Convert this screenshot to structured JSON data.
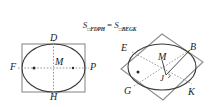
{
  "background_color": "#ffffff",
  "formula": {
    "left_symbol": "S",
    "left_quad_mark": "□",
    "left_subscript": "FDPH",
    "equals": "=",
    "right_symbol": "S",
    "right_quad_mark": "□",
    "right_subscript": "BEGK",
    "full_text": "S□FDPH = S□BEGK"
  },
  "colors": {
    "rectangle_stroke": "#8c8c8c",
    "ellipse_stroke": "#3a3a3a",
    "dashed_axis": "#9a9a9a",
    "label_text": "#1a1a1a",
    "focus_dot": "#2b2b2b",
    "diamond_stroke": "#8c8c8c"
  },
  "figure_left": {
    "name": "ellipse-in-axis-aligned-rectangle",
    "shape": "rectangle with inscribed ellipse",
    "labels": {
      "top": "D",
      "bottom": "H",
      "left": "F",
      "right": "P",
      "center": "M"
    },
    "features": {
      "major_axis": "horizontal dashed line F to P",
      "minor_axis": "vertical dashed line D to H",
      "focus_dots": 2,
      "center_marker": "M"
    }
  },
  "figure_right": {
    "name": "ellipse-in-rotated-rectangle",
    "shape": "rotated rectangle (diamond) with inscribed ellipse",
    "labels": {
      "top_left": "E",
      "top_right": "B",
      "bottom_left": "G",
      "bottom_right": "K",
      "center": "M",
      "foot": "J"
    },
    "features": {
      "conjugate_diameter_1": "dashed line E to K",
      "conjugate_diameter_2": "dashed line G to B",
      "right_angle_mark_at": "J",
      "focus_dots": 1,
      "segment_MJ": "M to J",
      "segment_JB": "J to B"
    }
  }
}
